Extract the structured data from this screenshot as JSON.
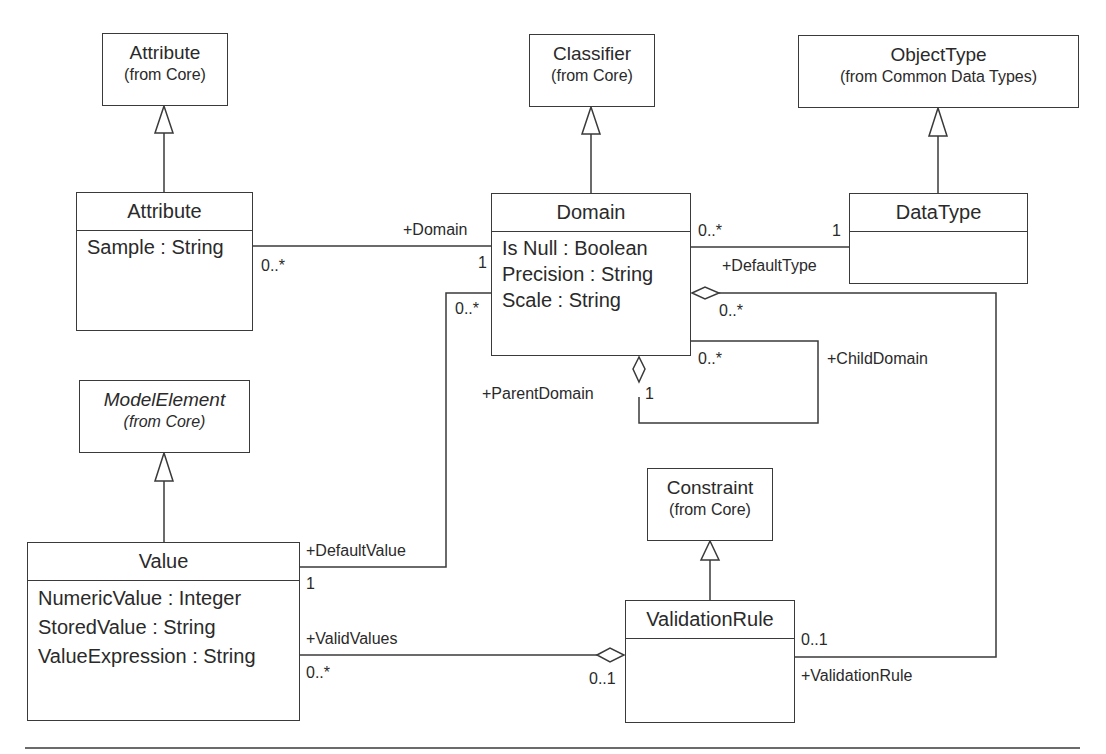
{
  "diagram": {
    "type": "UML class diagram",
    "packages": {
      "attribute_core": {
        "name": "Attribute",
        "source": "(from Core)"
      },
      "classifier_core": {
        "name": "Classifier",
        "source": "(from Core)"
      },
      "objecttype": {
        "name": "ObjectType",
        "source": "(from Common Data Types)"
      },
      "modelelement_core": {
        "name": "ModelElement",
        "source": "(from Core)"
      },
      "constraint_core": {
        "name": "Constraint",
        "source": "(from Core)"
      }
    },
    "classes": {
      "attribute": {
        "name": "Attribute",
        "attributes": [
          "Sample : String"
        ]
      },
      "domain": {
        "name": "Domain",
        "attributes": [
          "Is Null : Boolean",
          "Precision : String",
          "Scale : String"
        ]
      },
      "datatype": {
        "name": "DataType",
        "attributes": []
      },
      "value": {
        "name": "Value",
        "attributes": [
          "NumericValue : Integer",
          "StoredValue : String",
          "ValueExpression : String"
        ]
      },
      "validationrule": {
        "name": "ValidationRule",
        "attributes": []
      }
    },
    "associations": {
      "attribute_domain": {
        "role": "+Domain",
        "mult_attribute": "0..*",
        "mult_domain": "1"
      },
      "domain_datatype": {
        "role": "+DefaultType",
        "mult_domain": "0..*",
        "mult_datatype": "1"
      },
      "domain_self": {
        "parent_role": "+ParentDomain",
        "parent_mult": "1",
        "child_role": "+ChildDomain",
        "child_mult": "0..*"
      },
      "domain_value": {
        "role": "+DefaultValue",
        "mult_domain": "0..*",
        "mult_value": "1"
      },
      "value_validationrule": {
        "role": "+ValidValues",
        "mult_value": "0..*",
        "mult_rule": "0..1"
      },
      "domain_validationrule": {
        "role": "+ValidationRule",
        "mult_domain": "0..*",
        "mult_rule": "0..1"
      }
    }
  }
}
